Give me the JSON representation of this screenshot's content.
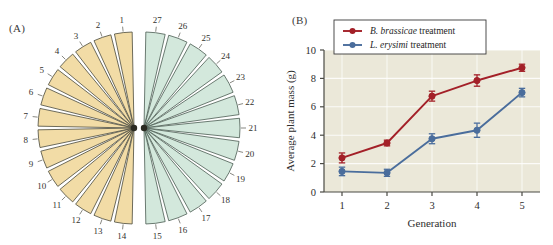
{
  "figure": {
    "panel_a_label": "(A)",
    "panel_b_label": "(B)"
  },
  "panel_a": {
    "title": "",
    "type": "split-radial-wedge-diagram",
    "group_left": {
      "name": "left-fan",
      "color": "#f2dca6",
      "stroke": "#4a4a3c",
      "numbers": [
        1,
        2,
        3,
        4,
        5,
        6,
        7,
        8,
        9,
        10,
        11,
        12,
        13,
        14
      ]
    },
    "group_right": {
      "name": "right-fan",
      "color": "#d3e8dc",
      "stroke": "#4a5c52",
      "numbers": [
        15,
        16,
        17,
        18,
        19,
        20,
        21,
        22,
        23,
        24,
        25,
        26,
        27
      ]
    },
    "total_wedges": 27
  },
  "chart_data": {
    "type": "line",
    "title": "",
    "xlabel": "Generation",
    "ylabel": "Average plant mass (g)",
    "x": [
      1,
      2,
      3,
      4,
      5
    ],
    "xticklabels": [
      "1",
      "2",
      "3",
      "4",
      "5"
    ],
    "yticklabels": [
      "0",
      "2",
      "4",
      "6",
      "8",
      "10"
    ],
    "yticks": [
      0,
      2,
      4,
      6,
      8,
      10
    ],
    "ylim": [
      0,
      10
    ],
    "xlim": [
      0.6,
      5.4
    ],
    "grid": true,
    "legend_position": "top-left",
    "plot_background": "#ebe8d9",
    "series": [
      {
        "name": "B. brassicae treatment",
        "species": "B. brassicae",
        "suffix": " treatment",
        "color": "#a32028",
        "values": [
          2.4,
          3.45,
          6.75,
          7.85,
          8.75
        ],
        "errors": [
          0.35,
          0.2,
          0.35,
          0.4,
          0.25
        ]
      },
      {
        "name": "L. erysimi treatment",
        "species": "L. erysimi",
        "suffix": " treatment",
        "color": "#4a6d9c",
        "values": [
          1.45,
          1.35,
          3.75,
          4.35,
          7.0
        ],
        "errors": [
          0.3,
          0.25,
          0.35,
          0.5,
          0.3
        ]
      }
    ]
  }
}
